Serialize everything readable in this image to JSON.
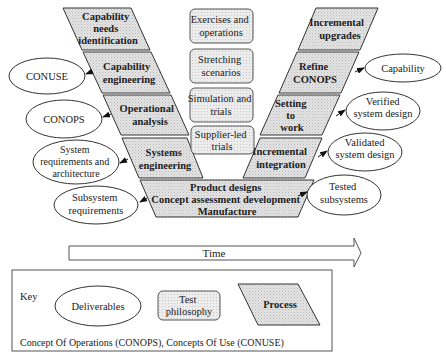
{
  "left_processes": [
    {
      "lines": [
        "Capability",
        "needs",
        "identification"
      ]
    },
    {
      "lines": [
        "Capability",
        "engineering"
      ]
    },
    {
      "lines": [
        "Operational",
        "analysis"
      ]
    },
    {
      "lines": [
        "Systems",
        "engineering"
      ]
    }
  ],
  "right_processes": [
    {
      "lines": [
        "Incremental",
        "upgrades"
      ]
    },
    {
      "lines": [
        "Refine",
        "CONOPS"
      ]
    },
    {
      "lines": [
        "Setting",
        "to",
        "work"
      ]
    },
    {
      "lines": [
        "Incremental",
        "integration"
      ]
    }
  ],
  "bottom_process": {
    "lines": [
      "Product designs",
      "Concept assessment development",
      "Manufacture"
    ]
  },
  "test_philosophies": [
    {
      "lines": [
        "Exercises and",
        "operations"
      ]
    },
    {
      "lines": [
        "Stretching",
        "scenarios"
      ]
    },
    {
      "lines": [
        "Simulation and",
        "trials"
      ]
    },
    {
      "lines": [
        "Supplier-led",
        "trials"
      ]
    }
  ],
  "left_deliverables": [
    {
      "lines": [
        "CONUSE"
      ]
    },
    {
      "lines": [
        "CONOPS"
      ]
    },
    {
      "lines": [
        "System",
        "requirements and",
        "architecture"
      ]
    },
    {
      "lines": [
        "Subsystem",
        "requirements"
      ]
    }
  ],
  "right_deliverables": [
    {
      "lines": [
        "Capability"
      ]
    },
    {
      "lines": [
        "Verified",
        "system design"
      ]
    },
    {
      "lines": [
        "Validated",
        "system design"
      ]
    },
    {
      "lines": [
        "Tested",
        "subsystems"
      ]
    }
  ],
  "time_arrow": {
    "label": "Time"
  },
  "key": {
    "title": "Key",
    "deliverables_label": "Deliverables",
    "test_label_lines": [
      "Test",
      "philosophy"
    ],
    "process_label": "Process",
    "footnote": "Concept Of Operations (CONOPS), Concepts Of Use (CONUSE)"
  },
  "colors": {
    "process_fill": "#dcdcdc",
    "stroke": "#333333",
    "test_fill": "#e6e6e6",
    "background": "#ffffff"
  }
}
